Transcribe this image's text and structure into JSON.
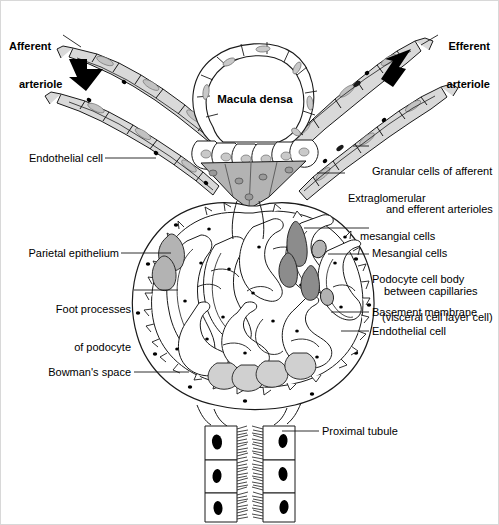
{
  "figure": {
    "type": "anatomical-line-diagram",
    "background_color": "#ffffff",
    "line_color": "#1a1a1a",
    "fill_light": "#d9d9d9",
    "fill_mid": "#b3b3b3",
    "fill_dark": "#8c8c8c",
    "nucleus_color": "#000000"
  },
  "labels": {
    "afferent_arteriole": "Afferent\narteriole",
    "efferent_arteriole": "Efferent\narteriole",
    "macula_densa": "Macula densa",
    "endothelial_cell_left": "Endothelial cell",
    "granular_cells": "Granular cells of afferent\nand efferent arterioles",
    "extraglomerular_mesangial": "Extraglomerular\nmesangial cells",
    "mesangial_cells": "Mesangial cells\nbetween capillaries",
    "podocyte_cell_body": "Podocyte cell body\n(visceral cell layer cell)",
    "parietal_epithelium": "Parietal epithelium",
    "foot_processes": "Foot processes\nof podocyte",
    "basement_membrane": "Basement membrane",
    "endothelial_cell_right": "Endothelial cell",
    "bowmans_space": "Bowman's space",
    "proximal_tubule": "Proximal tubule"
  },
  "label_lines": [
    {
      "name": "afferent-arteriole",
      "line1": "Afferent",
      "line2": "arteriole",
      "bold": true,
      "align": "left"
    },
    {
      "name": "efferent-arteriole",
      "line1": "Efferent",
      "line2": "arteriole",
      "bold": true,
      "align": "left"
    },
    {
      "name": "macula-densa",
      "line1": "Macula densa",
      "line2": "",
      "bold": true,
      "align": "center"
    },
    {
      "name": "endothelial-cell-left",
      "line1": "Endothelial cell",
      "line2": "",
      "bold": false,
      "align": "right"
    },
    {
      "name": "granular-cells",
      "line1": "Granular cells of afferent",
      "line2": "and efferent arterioles",
      "bold": false,
      "align": "left"
    },
    {
      "name": "extraglomerular-mesangial-cells",
      "line1": "Extraglomerular",
      "line2": "mesangial cells",
      "bold": false,
      "align": "left"
    },
    {
      "name": "mesangial-cells",
      "line1": "Mesangial cells",
      "line2": "between capillaries",
      "bold": false,
      "align": "left"
    },
    {
      "name": "podocyte-cell-body",
      "line1": "Podocyte cell body",
      "line2": "(visceral cell layer cell)",
      "bold": false,
      "align": "left"
    },
    {
      "name": "parietal-epithelium",
      "line1": "Parietal epithelium",
      "line2": "",
      "bold": false,
      "align": "right"
    },
    {
      "name": "foot-processes-of-podocyte",
      "line1": "Foot processes",
      "line2": "of podocyte",
      "bold": false,
      "align": "right"
    },
    {
      "name": "basement-membrane",
      "line1": "Basement membrane",
      "line2": "",
      "bold": false,
      "align": "left"
    },
    {
      "name": "endothelial-cell-right",
      "line1": "Endothelial cell",
      "line2": "",
      "bold": false,
      "align": "left"
    },
    {
      "name": "bowmans-space",
      "line1": "Bowman's space",
      "line2": "",
      "bold": false,
      "align": "right"
    },
    {
      "name": "proximal-tubule",
      "line1": "Proximal tubule",
      "line2": "",
      "bold": false,
      "align": "left"
    }
  ],
  "arrows": [
    {
      "name": "afferent-flow-arrow",
      "direction": "down-right",
      "color": "#000000"
    },
    {
      "name": "efferent-flow-arrow",
      "direction": "up-right",
      "color": "#000000"
    }
  ]
}
